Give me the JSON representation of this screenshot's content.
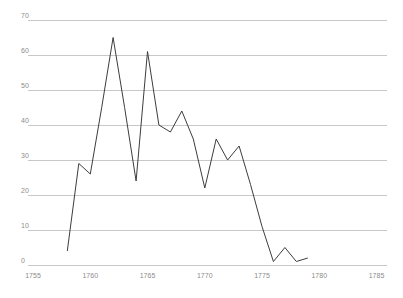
{
  "chart_data": {
    "type": "line",
    "title": "",
    "xlabel": "",
    "ylabel": "",
    "x": [
      1758,
      1759,
      1760,
      1761,
      1762,
      1763,
      1764,
      1765,
      1766,
      1767,
      1768,
      1769,
      1770,
      1771,
      1772,
      1773,
      1774,
      1775,
      1776,
      1777,
      1778,
      1779
    ],
    "values": [
      4,
      29,
      26,
      45,
      65,
      45,
      24,
      61,
      40,
      38,
      44,
      36,
      22,
      36,
      30,
      34,
      23,
      11,
      1,
      5,
      1,
      2
    ],
    "series_name": "value-per-year",
    "xlim": [
      1755,
      1785
    ],
    "ylim": [
      0,
      70
    ],
    "x_tick_labels": [
      "1755",
      "1760",
      "1765",
      "1770",
      "1775",
      "1780",
      "1785"
    ],
    "x_tick_values": [
      1755,
      1760,
      1765,
      1770,
      1775,
      1780,
      1785
    ],
    "y_tick_labels": [
      "0",
      "10",
      "20",
      "30",
      "40",
      "50",
      "60",
      "70"
    ],
    "y_tick_values": [
      0,
      10,
      20,
      30,
      40,
      50,
      60,
      70
    ],
    "grid": "horizontal",
    "legend": "none",
    "colors": {
      "line": "#3d3d3d",
      "grid": "#c8c8c8",
      "tick_label": "#8c8c8c",
      "background": "#ffffff"
    }
  }
}
